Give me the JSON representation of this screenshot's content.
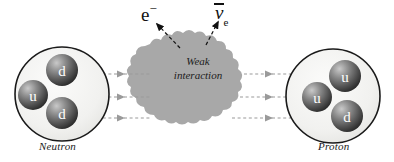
{
  "diagram": {
    "background_color": "#ffffff",
    "blob_color": "#a8a8a8",
    "nucleon_fill": "#f2f2f0",
    "nucleon_stroke": "#1a1a1a",
    "arrow_color": "#9a9a9a",
    "emission_arrow_color": "#111111"
  },
  "neutron": {
    "label": "Neutron",
    "quarks": [
      {
        "name": "d",
        "x": 62,
        "y": 70
      },
      {
        "name": "u",
        "x": 33,
        "y": 95
      },
      {
        "name": "d",
        "x": 62,
        "y": 113
      }
    ]
  },
  "proton": {
    "label": "Proton",
    "quarks": [
      {
        "name": "u",
        "x": 345,
        "y": 76
      },
      {
        "name": "u",
        "x": 317,
        "y": 97
      },
      {
        "name": "d",
        "x": 347,
        "y": 116
      }
    ]
  },
  "interaction": {
    "line1": "Weak",
    "line2": "interaction"
  },
  "emissions": {
    "electron": {
      "symbol": "e",
      "charge": "−"
    },
    "antineutrino": {
      "symbol": "ν",
      "subscript": "e"
    }
  },
  "quark_flow": {
    "count": 3,
    "y_positions": [
      74,
      97,
      118
    ]
  }
}
